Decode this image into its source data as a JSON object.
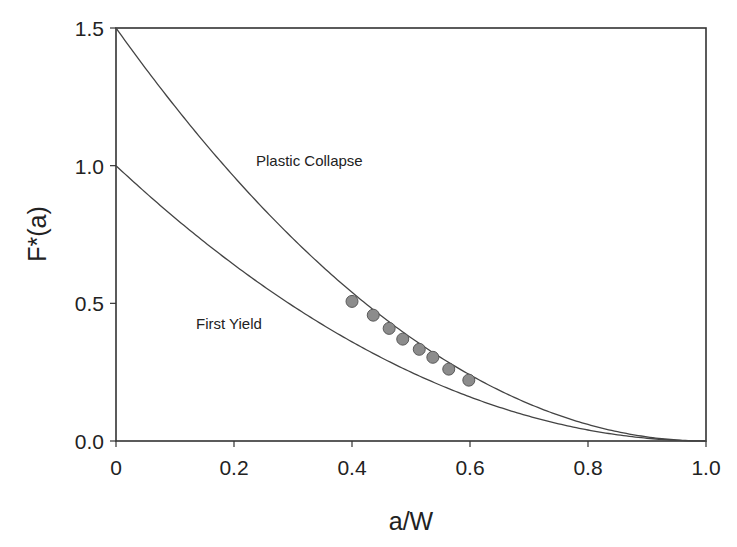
{
  "chart_data": {
    "type": "line",
    "title": "",
    "xlabel": "a/W",
    "ylabel": "F*(a)",
    "xlim": [
      0,
      1.0
    ],
    "ylim": [
      0,
      1.5
    ],
    "grid": false,
    "legend": null,
    "xticks": [
      "0",
      "0.2",
      "0.4",
      "0.6",
      "0.8",
      "1.0"
    ],
    "yticks": [
      "0.0",
      "0.5",
      "1.0",
      "1.5"
    ],
    "series": [
      {
        "name": "Plastic Collapse",
        "kind": "line",
        "formula": "1.5*(1-a/W)^2",
        "x": [
          0,
          0.1,
          0.2,
          0.3,
          0.4,
          0.5,
          0.6,
          0.7,
          0.8,
          0.9,
          1.0
        ],
        "values": [
          1.5,
          1.215,
          0.96,
          0.735,
          0.54,
          0.375,
          0.24,
          0.135,
          0.06,
          0.015,
          0.0
        ]
      },
      {
        "name": "First Yield",
        "kind": "line",
        "formula": "(1-a/W)^2",
        "x": [
          0,
          0.1,
          0.2,
          0.3,
          0.4,
          0.5,
          0.6,
          0.7,
          0.8,
          0.9,
          1.0
        ],
        "values": [
          1.0,
          0.81,
          0.64,
          0.49,
          0.36,
          0.25,
          0.16,
          0.09,
          0.04,
          0.01,
          0.0
        ]
      },
      {
        "name": "Experimental",
        "kind": "scatter",
        "x": [
          0.4,
          0.436,
          0.463,
          0.486,
          0.514,
          0.537,
          0.564,
          0.598
        ],
        "values": [
          0.507,
          0.457,
          0.409,
          0.37,
          0.333,
          0.304,
          0.261,
          0.221
        ]
      }
    ],
    "annotations": [
      {
        "text": "Plastic Collapse",
        "x": 0.24,
        "y": 1.0
      },
      {
        "text": "First Yield",
        "x": 0.13,
        "y": 0.46
      }
    ]
  },
  "colors": {
    "line": "#444444",
    "marker_fill": "#8c8c8c",
    "marker_stroke": "#5a5a5a",
    "axis": "#333333"
  }
}
